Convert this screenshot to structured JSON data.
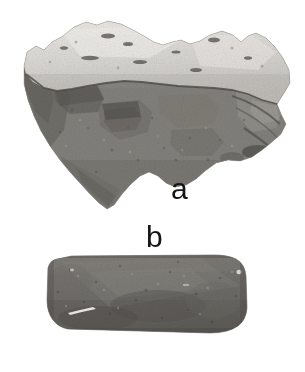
{
  "plate": {
    "width": 305,
    "height": 372,
    "background_color": "#ffffff",
    "media": "grayscale-photograph",
    "description": "Black and white photographic plate of two stone artifacts on a plain white background"
  },
  "figures": [
    {
      "id": "a",
      "label": "a",
      "name": "flaked-stone-core",
      "label_position": {
        "x": 171,
        "y": 174
      },
      "bounds": {
        "x": 22,
        "y": 20,
        "width": 268,
        "height": 190
      },
      "tones": {
        "cortex_light": "#d8d6d2",
        "cortex_highlight": "#efeeeb",
        "body_mid": "#8e8c88",
        "body_dark": "#5d5b58",
        "shadow": "#3c3a38"
      },
      "features": [
        "light weathered cortex across upper surface",
        "horizontal flake scar boundary near mid-height",
        "darker granular flaked body below",
        "irregular stepped left margin",
        "pointed lower-left termination",
        "jagged projecting right margin"
      ]
    },
    {
      "id": "b",
      "label": "b",
      "name": "ground-stone-celt",
      "label_position": {
        "x": 146,
        "y": 222
      },
      "bounds": {
        "x": 47,
        "y": 255,
        "width": 200,
        "height": 78
      },
      "tones": {
        "surface_mid": "#77756f",
        "surface_dark": "#585651",
        "surface_light": "#93918b",
        "scratch": "#f2f1ee"
      },
      "features": [
        "elongated rounded-rectangular celt or adze",
        "uniform dark granular surface",
        "white linear scratch highlight on lower left",
        "rounded corners and slightly convex edges"
      ]
    }
  ],
  "palette": {
    "background": "#ffffff",
    "ink": "#151515",
    "light_grey": "#d8d6d2",
    "mid_grey": "#8e8c88",
    "dark_grey": "#5d5b58"
  }
}
